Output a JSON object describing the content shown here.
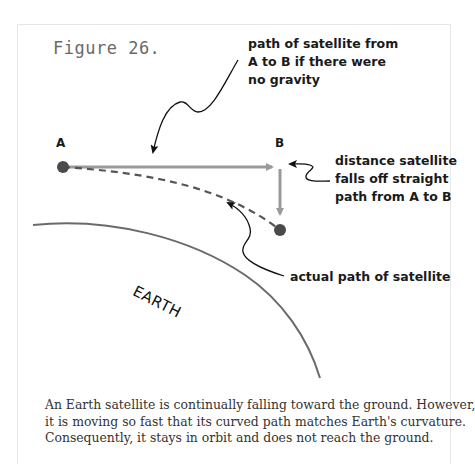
{
  "figure": {
    "title": "Figure 26.",
    "labels": {
      "no_gravity_path": [
        "path of satellite from",
        "A to B if there were",
        "no gravity"
      ],
      "fall_distance": [
        "distance satellite",
        "falls off straight",
        "path from A to B"
      ],
      "actual_path": "actual path of satellite",
      "earth": "EARTH",
      "point_a": "A",
      "point_b": "B"
    },
    "colors": {
      "straight_path": "#9a9a9a",
      "curved_path": "#555555",
      "earth_arc": "#6a6a6a",
      "points": "#4a4a4a",
      "pointer_arrows": "#111111"
    }
  },
  "caption": {
    "lines": [
      "An Earth satellite is continually falling toward the ground. However,",
      "it is moving so fast that its curved path matches Earth's curvature.",
      "Consequently, it stays in orbit and does not reach the ground."
    ]
  }
}
